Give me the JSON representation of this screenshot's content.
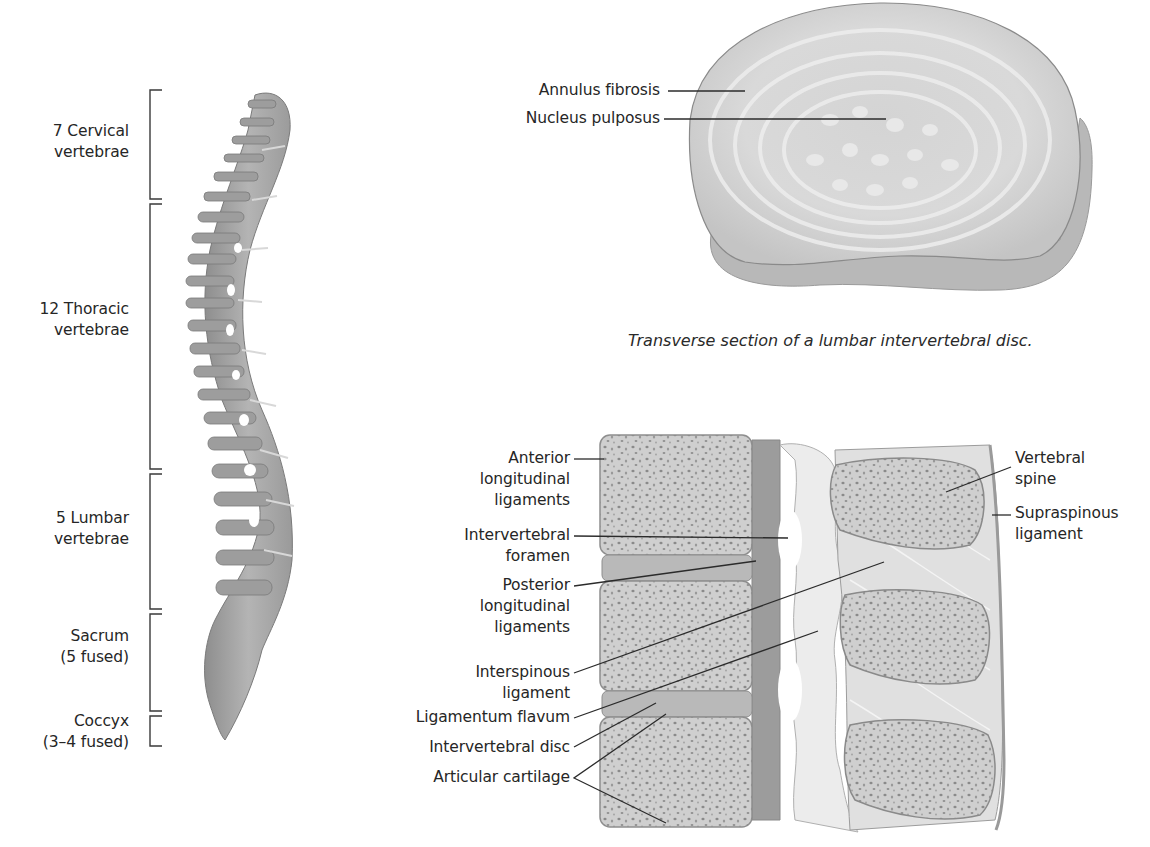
{
  "figure": {
    "spine_panel": {
      "regions": [
        {
          "line1": "7 Cervical",
          "line2": "vertebrae"
        },
        {
          "line1": "12 Thoracic",
          "line2": "vertebrae"
        },
        {
          "line1": "5 Lumbar",
          "line2": "vertebrae"
        },
        {
          "line1": "Sacrum",
          "line2": "(5 fused)"
        },
        {
          "line1": "Coccyx",
          "line2": "(3–4 fused)"
        }
      ]
    },
    "disc_panel": {
      "labels": [
        "Annulus fibrosis",
        "Nucleus pulposus"
      ],
      "caption": "Transverse section of a lumbar intervertebral disc."
    },
    "sagittal_panel": {
      "left_labels": [
        {
          "lines": [
            "Anterior",
            "longitudinal",
            "ligaments"
          ]
        },
        {
          "lines": [
            "Intervertebral",
            "foramen"
          ]
        },
        {
          "lines": [
            "Posterior",
            "longitudinal",
            "ligaments"
          ]
        },
        {
          "lines": [
            "Interspinous",
            "ligament"
          ]
        },
        {
          "lines": [
            "Ligamentum flavum"
          ]
        },
        {
          "lines": [
            "Intervertebral disc"
          ]
        },
        {
          "lines": [
            "Articular cartilage"
          ]
        }
      ],
      "right_labels": [
        {
          "lines": [
            "Vertebral",
            "spine"
          ]
        },
        {
          "lines": [
            "Supraspinous",
            "ligament"
          ]
        }
      ]
    },
    "colors": {
      "bone": "#a9a9a9",
      "bone_light": "#c9c9c9",
      "ligament": "#e6e6e6",
      "line": "#2b2b2b"
    }
  }
}
